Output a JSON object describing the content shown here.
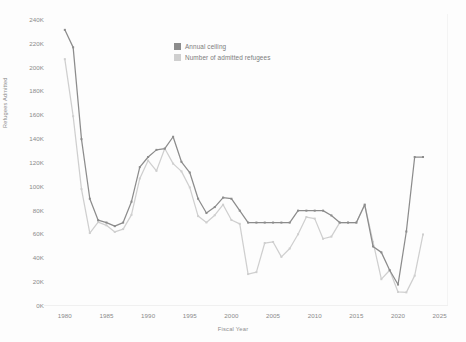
{
  "top_fragment": "",
  "axis": {
    "y_title": "Refugees Admitted",
    "x_title": "Fiscal Year",
    "y_ticks": [
      "0K",
      "20K",
      "40K",
      "60K",
      "80K",
      "100K",
      "120K",
      "140K",
      "160K",
      "180K",
      "200K",
      "220K",
      "240K"
    ],
    "x_ticks": [
      "1980",
      "1985",
      "1990",
      "1995",
      "2000",
      "2005",
      "2010",
      "2015",
      "2020",
      "2025"
    ]
  },
  "legend": {
    "items": [
      {
        "label": "Annual ceiling",
        "color": "#8c8c8c"
      },
      {
        "label": "Number of admitted refugees",
        "color": "#cfcfcf"
      }
    ]
  },
  "chart_data": {
    "type": "line",
    "title": "",
    "xlabel": "Fiscal Year",
    "ylabel": "Refugees Admitted",
    "xlim": [
      1977.5,
      2026
    ],
    "ylim": [
      0,
      245000
    ],
    "grid": false,
    "legend_position": "inside-top-center",
    "x": [
      1980,
      1981,
      1982,
      1983,
      1984,
      1985,
      1986,
      1987,
      1988,
      1989,
      1990,
      1991,
      1992,
      1993,
      1994,
      1995,
      1996,
      1997,
      1998,
      1999,
      2000,
      2001,
      2002,
      2003,
      2004,
      2005,
      2006,
      2007,
      2008,
      2009,
      2010,
      2011,
      2012,
      2013,
      2014,
      2015,
      2016,
      2017,
      2018,
      2019,
      2020,
      2021,
      2022,
      2023
    ],
    "series": [
      {
        "name": "Annual ceiling",
        "color": "#8c8c8c",
        "values": [
          231700,
          217000,
          140000,
          90000,
          72000,
          70000,
          67000,
          70000,
          87500,
          116500,
          125000,
          131000,
          132000,
          142000,
          121000,
          112000,
          90000,
          78000,
          83000,
          91000,
          90000,
          80000,
          70000,
          70000,
          70000,
          70000,
          70000,
          70000,
          80000,
          80000,
          80000,
          80000,
          76000,
          70000,
          70000,
          70000,
          85000,
          50000,
          45000,
          30000,
          18000,
          62500,
          125000,
          125000
        ]
      },
      {
        "name": "Number of admitted refugees",
        "color": "#cfcfcf",
        "values": [
          207116,
          159252,
          98096,
          61218,
          70393,
          67704,
          62146,
          64528,
          76483,
          107000,
          122066,
          113389,
          132173,
          119448,
          112981,
          99490,
          75421,
          70085,
          76181,
          85006,
          72143,
          68925,
          26788,
          28403,
          52837,
          53738,
          41223,
          48281,
          60191,
          74654,
          73311,
          56424,
          58238,
          69926,
          69987,
          69933,
          84994,
          53716,
          22491,
          30000,
          11814,
          11411,
          25465,
          60014
        ]
      }
    ]
  }
}
